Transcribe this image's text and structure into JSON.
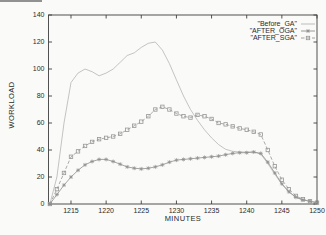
{
  "colors": {
    "axis": "#3f3f3f",
    "text": "#2b2b2b",
    "background": "#fafaf8"
  },
  "chart_data": {
    "type": "line",
    "title": "",
    "xlabel": "MINUTES",
    "ylabel": "WORKLOAD",
    "xlim": [
      1211.8,
      1250
    ],
    "ylim": [
      0,
      140
    ],
    "x_ticks": [
      1215,
      1220,
      1225,
      1230,
      1235,
      1240,
      1245,
      1250
    ],
    "y_ticks": [
      0,
      20,
      40,
      60,
      80,
      100,
      120,
      140
    ],
    "grid": false,
    "legend_position": "top-right-inside",
    "x": [
      1212,
      1213,
      1214,
      1215,
      1216,
      1217,
      1218,
      1219,
      1220,
      1221,
      1222,
      1223,
      1224,
      1225,
      1226,
      1227,
      1228,
      1229,
      1230,
      1231,
      1232,
      1233,
      1234,
      1235,
      1236,
      1237,
      1238,
      1239,
      1240,
      1241,
      1242,
      1243,
      1244,
      1245,
      1246,
      1247,
      1248,
      1249,
      1250
    ],
    "series": [
      {
        "name": "\"Before_GA\"",
        "marker": "none",
        "dash": "solid",
        "color": "#b5b5b5",
        "values": [
          0,
          20,
          60,
          90,
          97,
          100,
          98,
          95,
          97,
          100,
          105,
          110,
          112,
          116,
          119,
          120,
          114,
          104,
          92,
          80,
          70,
          62,
          55,
          49,
          44,
          40.5,
          39,
          38.5,
          38.5,
          38.5,
          37,
          30,
          22,
          14.5,
          9,
          5,
          3,
          2,
          1
        ]
      },
      {
        "name": "\"AFTER_OGA\"",
        "marker": "asterisk",
        "dash": "solid",
        "color": "#8f8f8f",
        "values": [
          0,
          7,
          14,
          20,
          25,
          29,
          31.5,
          33,
          33,
          31.5,
          29.5,
          27.5,
          26.5,
          26,
          26.5,
          27.5,
          29,
          31,
          32.5,
          33,
          33.5,
          34,
          34.5,
          35,
          35.5,
          36.5,
          37.5,
          38,
          38,
          38.5,
          37.5,
          31,
          23,
          15,
          9,
          5,
          3,
          2,
          1
        ]
      },
      {
        "name": "\"AFTER_SGA\"",
        "marker": "square",
        "dash": "dashed",
        "color": "#979797",
        "values": [
          0,
          11,
          23,
          35,
          39,
          43,
          46,
          48,
          49,
          50,
          52,
          55,
          58,
          61,
          65,
          70,
          72,
          70,
          67,
          65,
          64,
          66,
          65,
          63,
          60,
          59,
          57.5,
          56,
          55,
          53.5,
          51.5,
          40,
          28,
          18,
          11,
          6,
          3.5,
          2,
          1
        ]
      }
    ]
  }
}
